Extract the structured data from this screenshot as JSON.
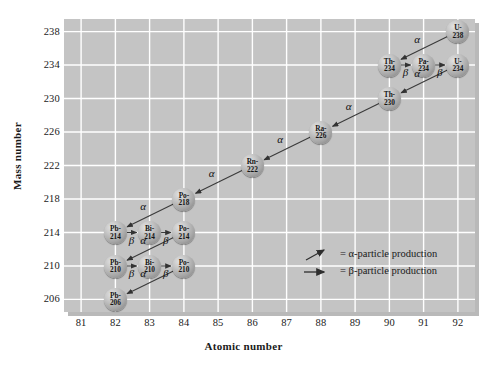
{
  "chart_data": {
    "type": "scatter",
    "title": "",
    "xlabel": "Atomic number",
    "ylabel": "Mass number",
    "xlim": [
      80.5,
      92.5
    ],
    "ylim": [
      204.5,
      239.5
    ],
    "xticks": [
      81,
      82,
      83,
      84,
      85,
      86,
      87,
      88,
      89,
      90,
      91,
      92
    ],
    "yticks": [
      206,
      210,
      214,
      218,
      222,
      226,
      230,
      234,
      238
    ],
    "grid": true,
    "legend_position": "center-right",
    "nuclides": [
      {
        "symbol": "U-",
        "sym": "U-",
        "mass": "238",
        "z": 92,
        "a": 238
      },
      {
        "symbol": "Th-",
        "sym": "Th-",
        "mass": "234",
        "z": 90,
        "a": 234
      },
      {
        "symbol": "Pa-",
        "sym": "Pa-",
        "mass": "234",
        "z": 91,
        "a": 234
      },
      {
        "symbol": "U-",
        "sym": "U-",
        "mass": "234",
        "z": 92,
        "a": 234
      },
      {
        "symbol": "Th-",
        "sym": "Th-",
        "mass": "230",
        "z": 90,
        "a": 230
      },
      {
        "symbol": "Ra-",
        "sym": "Ra-",
        "mass": "226",
        "z": 88,
        "a": 226
      },
      {
        "symbol": "Rn-",
        "sym": "Rn-",
        "mass": "222",
        "z": 86,
        "a": 222
      },
      {
        "symbol": "Po-",
        "sym": "Po-",
        "mass": "218",
        "z": 84,
        "a": 218
      },
      {
        "symbol": "Pb-",
        "sym": "Pb-",
        "mass": "214",
        "z": 82,
        "a": 214
      },
      {
        "symbol": "Bi-",
        "sym": "Bi-",
        "mass": "214",
        "z": 83,
        "a": 214
      },
      {
        "symbol": "Po-",
        "sym": "Po-",
        "mass": "214",
        "z": 84,
        "a": 214
      },
      {
        "symbol": "Pb-",
        "sym": "Pb-",
        "mass": "210",
        "z": 82,
        "a": 210
      },
      {
        "symbol": "Bi-",
        "sym": "Bi-",
        "mass": "210",
        "z": 83,
        "a": 210
      },
      {
        "symbol": "Po-",
        "sym": "Po-",
        "mass": "210",
        "z": 84,
        "a": 210
      },
      {
        "symbol": "Pb-",
        "sym": "Pb-",
        "mass": "206",
        "z": 82,
        "a": 206
      }
    ],
    "decays": [
      {
        "from": "U-238",
        "to": "Th-234",
        "type": "alpha",
        "label": "α"
      },
      {
        "from": "Th-234",
        "to": "Pa-234",
        "type": "beta",
        "label": "β"
      },
      {
        "from": "Pa-234",
        "to": "U-234",
        "type": "beta",
        "label": "β"
      },
      {
        "from": "U-234",
        "to": "Th-230",
        "type": "alpha",
        "label": "α"
      },
      {
        "from": "Th-230",
        "to": "Ra-226",
        "type": "alpha",
        "label": "α"
      },
      {
        "from": "Ra-226",
        "to": "Rn-222",
        "type": "alpha",
        "label": "α"
      },
      {
        "from": "Rn-222",
        "to": "Po-218",
        "type": "alpha",
        "label": "α"
      },
      {
        "from": "Po-218",
        "to": "Pb-214",
        "type": "alpha",
        "label": "α"
      },
      {
        "from": "Pb-214",
        "to": "Bi-214",
        "type": "beta",
        "label": "β"
      },
      {
        "from": "Bi-214",
        "to": "Po-214",
        "type": "beta",
        "label": "β"
      },
      {
        "from": "Po-214",
        "to": "Pb-210",
        "type": "alpha",
        "label": "α"
      },
      {
        "from": "Pb-210",
        "to": "Bi-210",
        "type": "beta",
        "label": "β"
      },
      {
        "from": "Bi-210",
        "to": "Po-210",
        "type": "beta",
        "label": "β"
      },
      {
        "from": "Po-210",
        "to": "Pb-206",
        "type": "alpha",
        "label": "α"
      }
    ],
    "legend": [
      {
        "icon": "diagonal-arrow",
        "text": "= α-particle production"
      },
      {
        "icon": "horizontal-arrow",
        "text": "= β-particle production"
      }
    ],
    "colors": {
      "plot_background": "#c4c4c4",
      "gridline": "#ffffff",
      "node_fill": "#a8a8a8",
      "arrow": "#3a3a3a",
      "text": "#1a1a1a",
      "page_background": "#ffffff"
    }
  },
  "axes": {
    "x_label": "Atomic number",
    "y_label": "Mass number",
    "x_ticks": [
      "81",
      "82",
      "83",
      "84",
      "85",
      "86",
      "87",
      "88",
      "89",
      "90",
      "91",
      "92"
    ],
    "y_ticks": [
      "238",
      "234",
      "230",
      "226",
      "222",
      "218",
      "214",
      "210",
      "206"
    ]
  },
  "greek": {
    "alpha": "α",
    "beta": "β"
  },
  "legend": {
    "alpha_text": "= α-particle production",
    "beta_text": "= β-particle production"
  }
}
